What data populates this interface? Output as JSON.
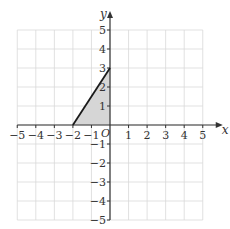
{
  "chart_data": {
    "type": "area",
    "title": "",
    "xlabel": "x",
    "ylabel": "y",
    "origin_label": "O",
    "xlim": [
      -5,
      5
    ],
    "ylim": [
      -5,
      5
    ],
    "grid": true,
    "x_ticks": [
      -5,
      -4,
      -3,
      -2,
      -1,
      1,
      2,
      3,
      4,
      5
    ],
    "y_ticks": [
      -5,
      -4,
      -3,
      -2,
      -1,
      1,
      2,
      3,
      4,
      5
    ],
    "x_tick_labels": [
      "−5",
      "−4",
      "−3",
      "−2",
      "−1",
      "1",
      "2",
      "3",
      "4",
      "5"
    ],
    "y_tick_labels": [
      "−5",
      "−4",
      "−3",
      "−2",
      "−1",
      "1",
      "2",
      "3",
      "4",
      "5"
    ],
    "shaded_region": {
      "name": "triangle",
      "vertices": [
        [
          -2,
          0
        ],
        [
          0,
          3
        ],
        [
          0,
          0
        ]
      ],
      "fill": "#d6d6d6"
    },
    "line_segment": {
      "from": [
        -2,
        0
      ],
      "to": [
        0,
        3
      ],
      "color": "#1a1a1a"
    }
  }
}
